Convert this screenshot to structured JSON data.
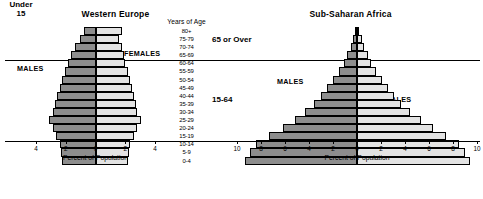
{
  "figure": {
    "axis_title": "Percent of Population",
    "age_header": "Years of Age"
  },
  "panels": {
    "west": {
      "title": "Western Europe",
      "males_label": "MALES",
      "females_label": "FEMALES",
      "axis_title": "Percent of Population"
    },
    "africa": {
      "title": "Sub-Saharan Africa",
      "males_label": "MALES",
      "females_label": "FEMALES",
      "axis_title": "Percent of Population"
    }
  },
  "groups": {
    "over65": "65 or Over",
    "working": "15-64",
    "under15_line1": "Under",
    "under15_line2": "15"
  },
  "chart_data": [
    {
      "type": "bar",
      "title": "Western Europe",
      "subtitle": "Population pyramid by age and sex",
      "orientation": "horizontal-diverging",
      "xlabel": "Percent of Population",
      "ylabel": "Years of Age",
      "xlim": [
        -5,
        5
      ],
      "xticks": [
        4,
        2,
        0,
        2,
        4
      ],
      "xtick_labels": [
        "4",
        "2",
        "0",
        "2",
        "4"
      ],
      "grid": false,
      "legend": [
        "MALES",
        "FEMALES"
      ],
      "colors": {
        "males": "#8d8d8d",
        "females": "#e3e3e3"
      },
      "categories": [
        "80+",
        "75-79",
        "70-74",
        "65-69",
        "60-64",
        "55-59",
        "50-54",
        "45-49",
        "40-44",
        "35-39",
        "30-34",
        "25-29",
        "20-24",
        "15-19",
        "10-14",
        "5-9",
        "0-4"
      ],
      "series": [
        {
          "name": "MALES",
          "values": [
            1.0,
            1.3,
            1.7,
            2.1,
            2.3,
            2.6,
            2.8,
            3.0,
            3.2,
            3.4,
            3.6,
            3.9,
            3.6,
            3.3,
            3.0,
            2.9,
            2.8
          ]
        },
        {
          "name": "FEMALES",
          "values": [
            2.2,
            2.0,
            2.2,
            2.4,
            2.5,
            2.7,
            2.9,
            3.1,
            3.2,
            3.4,
            3.5,
            3.8,
            3.5,
            3.2,
            2.9,
            2.8,
            2.7
          ]
        }
      ]
    },
    {
      "type": "bar",
      "title": "Sub-Saharan Africa",
      "subtitle": "Population pyramid by age and sex",
      "orientation": "horizontal-diverging",
      "xlabel": "Percent of Population",
      "ylabel": "Years of Age",
      "xlim": [
        -10,
        10
      ],
      "xticks": [
        10,
        8,
        6,
        4,
        2,
        0,
        2,
        4,
        6,
        8,
        10
      ],
      "xtick_labels": [
        "10",
        "8",
        "6",
        "4",
        "2",
        "0",
        "2",
        "4",
        "6",
        "8",
        "10"
      ],
      "grid": false,
      "legend": [
        "MALES",
        "FEMALES"
      ],
      "colors": {
        "males": "#8d8d8d",
        "females": "#e3e3e3"
      },
      "categories": [
        "80+",
        "75-79",
        "70-74",
        "65-69",
        "60-64",
        "55-59",
        "50-54",
        "45-49",
        "40-44",
        "35-39",
        "30-34",
        "25-29",
        "20-24",
        "15-19",
        "10-14",
        "5-9",
        "0-4"
      ],
      "series": [
        {
          "name": "MALES",
          "values": [
            0.2,
            0.3,
            0.5,
            0.8,
            1.1,
            1.5,
            2.0,
            2.5,
            3.0,
            3.6,
            4.3,
            5.2,
            6.2,
            7.3,
            8.4,
            8.9,
            9.3
          ]
        },
        {
          "name": "FEMALES",
          "values": [
            0.2,
            0.4,
            0.6,
            0.9,
            1.2,
            1.6,
            2.1,
            2.6,
            3.1,
            3.7,
            4.4,
            5.3,
            6.3,
            7.4,
            8.5,
            9.0,
            9.4
          ]
        }
      ]
    }
  ]
}
